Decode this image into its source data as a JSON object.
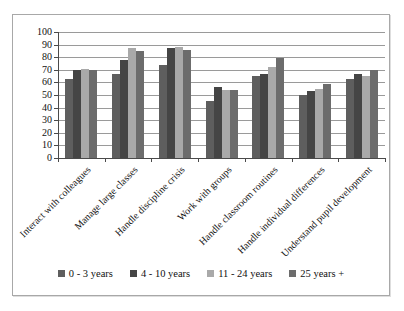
{
  "chart_data": {
    "type": "bar",
    "title": "",
    "xlabel": "",
    "ylabel": "",
    "categories": [
      "Interact with colleagues",
      "Manage large classes",
      "Handle discipline crisis",
      "Work with groups",
      "Handle classroom routines",
      "Handle individual differences",
      "Understand pupil development"
    ],
    "series": [
      {
        "name": "0 - 3 years",
        "color": "#5e5e5e",
        "values": [
          63,
          67,
          74,
          45,
          65,
          50,
          63
        ]
      },
      {
        "name": "4 - 10 years",
        "color": "#454545",
        "values": [
          70,
          78,
          87,
          56,
          67,
          53,
          67
        ]
      },
      {
        "name": "11 - 24 years",
        "color": "#a9a9a9",
        "values": [
          71,
          87,
          88,
          54,
          72,
          55,
          65
        ]
      },
      {
        "name": "25 years +",
        "color": "#6c6c6c",
        "values": [
          70,
          85,
          86,
          54,
          79,
          59,
          70
        ]
      }
    ],
    "ylim": [
      0,
      100
    ],
    "yticks": [
      0,
      10,
      20,
      30,
      40,
      50,
      60,
      70,
      80,
      90,
      100
    ],
    "grid": true,
    "legend_position": "bottom"
  }
}
